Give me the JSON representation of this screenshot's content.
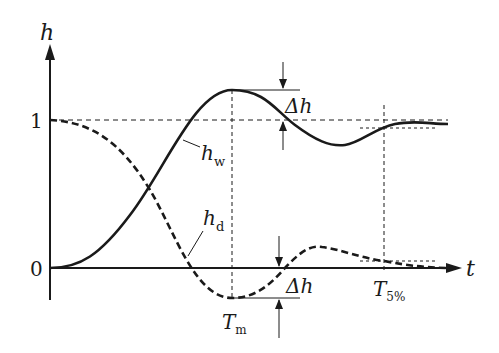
{
  "diagram": {
    "type": "step-response",
    "axes": {
      "y_label": "h",
      "x_label": "t",
      "y_ticks": [
        "1",
        "0"
      ]
    },
    "curves": [
      {
        "name": "h_w",
        "label_main": "h",
        "label_sub": "w",
        "style": "solid"
      },
      {
        "name": "h_d",
        "label_main": "h",
        "label_sub": "d",
        "style": "dashed"
      }
    ],
    "annotations": {
      "overshoot_top": {
        "main": "Δh"
      },
      "overshoot_bottom": {
        "main": "Δh"
      },
      "peak_time": {
        "main": "T",
        "sub": "m"
      },
      "settling_time": {
        "main": "T",
        "sub": "5%"
      }
    },
    "colors": {
      "ink": "#1a1a1a",
      "background": "#ffffff"
    }
  }
}
